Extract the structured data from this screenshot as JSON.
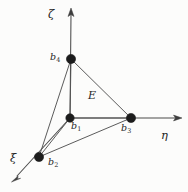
{
  "figure": {
    "kind": "3d-coordinate-axes-tetrahedron",
    "background_color": "#fcfcfb",
    "line_color": "#525252",
    "axis_color": "#4a4a4a",
    "node_color": "#1c1c1c",
    "label_color": "#262626",
    "width": 188,
    "height": 192
  },
  "axes": [
    {
      "id": "zeta",
      "label": "ζ",
      "label_x": 48,
      "label_y": 9,
      "origin_x": 70,
      "origin_y": 118,
      "tip_x": 71,
      "tip_y": 9,
      "direction": "up"
    },
    {
      "id": "eta",
      "label": "η",
      "label_x": 161,
      "label_y": 130,
      "origin_x": 70,
      "origin_y": 118,
      "tip_x": 181,
      "tip_y": 118,
      "direction": "right"
    },
    {
      "id": "xi",
      "label": "ξ",
      "label_x": 10,
      "label_y": 153,
      "origin_x": 70,
      "origin_y": 118,
      "tip_x": 12,
      "tip_y": 181,
      "direction": "down-left"
    }
  ],
  "nodes": [
    {
      "id": "b1",
      "label": "b",
      "sub": "1",
      "x": 70,
      "y": 118,
      "label_x": 71,
      "label_y": 121,
      "radius": 4.2
    },
    {
      "id": "b2",
      "label": "b",
      "sub": "2",
      "x": 39,
      "y": 157,
      "label_x": 48,
      "label_y": 157,
      "radius": 4.6
    },
    {
      "id": "b3",
      "label": "b",
      "sub": "3",
      "x": 131,
      "y": 118,
      "label_x": 121,
      "label_y": 123,
      "radius": 4.6
    },
    {
      "id": "b4",
      "label": "b",
      "sub": "4",
      "x": 71,
      "y": 59,
      "label_x": 50,
      "label_y": 52,
      "radius": 4.6
    }
  ],
  "edges": [
    {
      "from": "b4",
      "to": "b1"
    },
    {
      "from": "b4",
      "to": "b3"
    },
    {
      "from": "b4",
      "to": "b2"
    },
    {
      "from": "b1",
      "to": "b3"
    },
    {
      "from": "b1",
      "to": "b2"
    },
    {
      "from": "b2",
      "to": "b3"
    }
  ],
  "region_labels": [
    {
      "id": "E",
      "label": "E",
      "x": 88,
      "y": 90
    }
  ]
}
